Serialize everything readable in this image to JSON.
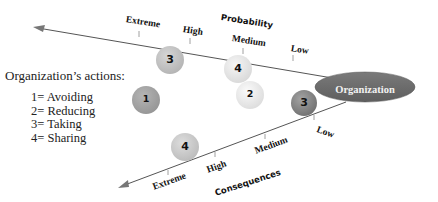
{
  "legend": {
    "title": "Organization’s actions:",
    "items": [
      {
        "code": "1",
        "label": "1= Avoiding"
      },
      {
        "code": "2",
        "label": "2= Reducing"
      },
      {
        "code": "3",
        "label": "3= Taking"
      },
      {
        "code": "4",
        "label": "4= Sharing"
      }
    ]
  },
  "probability_axis": {
    "title": "Probability",
    "ticks": [
      "Extreme",
      "High",
      "Medium",
      "Low"
    ]
  },
  "consequences_axis": {
    "title": "Consequences",
    "ticks": [
      "Extreme",
      "High",
      "Medium",
      "Low"
    ]
  },
  "organization": {
    "label": "Organization",
    "color": "#6e6e6e"
  },
  "bubbles": [
    {
      "number": "3",
      "color": "#c4c4c4",
      "position": "probability high/extreme"
    },
    {
      "number": "4",
      "color": "#e8e8e8",
      "position": "probability medium"
    },
    {
      "number": "1",
      "color": "#a6a6a6",
      "position": "left middle"
    },
    {
      "number": "2",
      "color": "#ececec",
      "position": "center"
    },
    {
      "number": "3",
      "color": "#8c8c8c",
      "position": "consequences low"
    },
    {
      "number": "4",
      "color": "#cdcdcd",
      "position": "consequences extreme/high"
    }
  ]
}
